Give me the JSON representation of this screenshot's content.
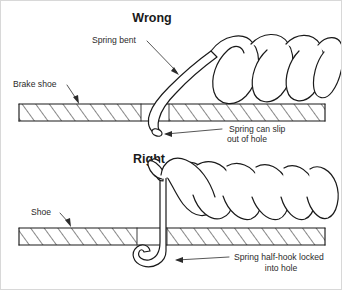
{
  "figure": {
    "title_wrong": "Wrong",
    "title_right": "Right"
  },
  "labels": {
    "spring_bent": "Spring bent",
    "brake_shoe": "Brake shoe",
    "shoe": "Shoe",
    "slip_line1": "Spring can slip",
    "slip_line2": "out of hole",
    "locked_line1": "Spring half-hook locked",
    "locked_line2": "into hole"
  },
  "colors": {
    "ink": "#1a1a1a",
    "text": "#2b2b2b",
    "background": "#ffffff",
    "border": "#d8d8d8"
  },
  "icons": {
    "arrow_spring_bent": "arrow-down-right-icon",
    "arrow_brake_shoe": "arrow-down-icon",
    "arrow_shoe": "arrow-down-icon",
    "arrow_slip": "arrow-left-icon",
    "arrow_locked": "arrow-left-icon"
  },
  "geometry": {
    "wrong_coil_count": 4,
    "right_coil_count": 6
  }
}
